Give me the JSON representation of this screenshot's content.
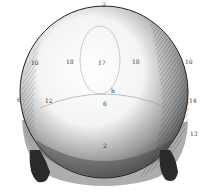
{
  "figure": {
    "colors": {
      "ink": "#1a1a1a",
      "paper": "#ffffff",
      "shade": "#555555"
    },
    "labels": [
      {
        "text": "2",
        "x": 102,
        "y": 5
      },
      {
        "text": "10",
        "x": 33,
        "y": 63
      },
      {
        "text": "18",
        "x": 68,
        "y": 62
      },
      {
        "text": "17",
        "x": 101,
        "y": 63
      },
      {
        "text": "18",
        "x": 134,
        "y": 62
      },
      {
        "text": "10",
        "x": 187,
        "y": 62
      },
      {
        "text": "12",
        "x": 47,
        "y": 101
      },
      {
        "text": "b",
        "x": 112,
        "y": 91
      },
      {
        "text": "6",
        "x": 104,
        "y": 104
      },
      {
        "text": "14",
        "x": 191,
        "y": 101
      },
      {
        "text": "13",
        "x": 192,
        "y": 134
      },
      {
        "text": "2",
        "x": 104,
        "y": 146
      },
      {
        "text": "6",
        "x": 19,
        "y": 100
      }
    ]
  }
}
